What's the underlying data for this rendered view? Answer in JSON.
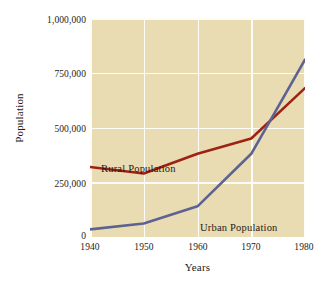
{
  "chart_data": {
    "type": "line",
    "title": "",
    "xlabel": "Years",
    "ylabel": "Population",
    "x": [
      1940,
      1950,
      1960,
      1970,
      1980
    ],
    "xtick_labels": [
      "1940",
      "1950",
      "1960",
      "1970",
      "1980"
    ],
    "ytick_labels": [
      "1,000,000",
      "750,000",
      "500,000",
      "250,000",
      "0"
    ],
    "ytick_values": [
      1000000,
      750000,
      500000,
      250000,
      0
    ],
    "xlim": [
      1940,
      1980
    ],
    "ylim": [
      0,
      1000000
    ],
    "grid": true,
    "legend_position": "inline-annotations",
    "plot_background_color": "#e9dcb2",
    "gridline_color": "#fdfcf6",
    "series": [
      {
        "name": "Rural Population",
        "color": "#9e2214",
        "values": [
          320000,
          290000,
          380000,
          450000,
          680000
        ],
        "label_text": "Rural Population"
      },
      {
        "name": "Urban Population",
        "color": "#5d6292",
        "values": [
          35000,
          62000,
          140000,
          380000,
          810000
        ],
        "label_text": "Urban Population"
      }
    ],
    "annotations": [
      {
        "text": "Rural Population",
        "color": "#1d1b16"
      },
      {
        "text": "Urban Population",
        "color": "#1d1b16"
      }
    ]
  }
}
